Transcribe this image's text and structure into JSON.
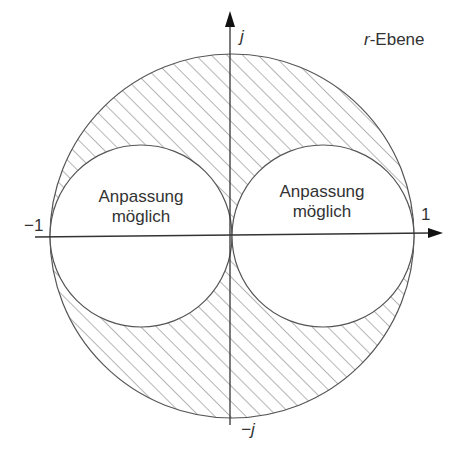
{
  "diagram": {
    "title": "r-Ebene",
    "title_prefix": "r",
    "title_suffix": "-Ebene",
    "axes": {
      "real_positive_label": "1",
      "real_negative_label": "−1",
      "imag_positive_label": "j",
      "imag_negative_label": "−j"
    },
    "regions": {
      "left_circle_label_line1": "Anpassung",
      "left_circle_label_line2": "möglich",
      "right_circle_label_line1": "Anpassung",
      "right_circle_label_line2": "möglich",
      "hatched_region": "outside both inner circles, inside unit circle"
    },
    "colors": {
      "line": "#555555",
      "hatch": "#777777",
      "text": "#333333",
      "background": "#ffffff"
    }
  }
}
